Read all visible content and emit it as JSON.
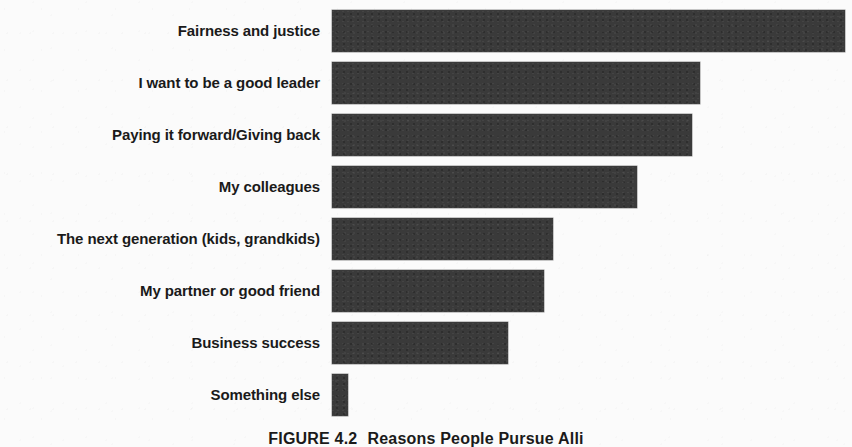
{
  "figure": {
    "caption_label": "FIGURE 4.2",
    "caption_text": "Reasons People Pursue Alli",
    "background_color": "#fbfbfb",
    "bar_color": "#3a3a3a",
    "text_color": "#1a1a1a"
  },
  "chart_data": {
    "type": "bar",
    "orientation": "horizontal",
    "title": "",
    "subtitle": "",
    "xlabel": "",
    "ylabel": "",
    "grid": false,
    "legend": false,
    "axis_visible": false,
    "tick_labels_visible": false,
    "value_labels_visible": false,
    "xlim": [
      0,
      100
    ],
    "categories": [
      "Fairness and justice",
      "I want to be a good leader",
      "Paying it forward/Giving back",
      "My colleagues",
      "The next generation (kids, grandkids)",
      "My partner or good friend",
      "Business success",
      "Something else"
    ],
    "values": [
      100,
      71.8,
      70.2,
      59.5,
      43.1,
      41.3,
      34.3,
      3.1
    ],
    "bar_pixel_widths": [
      513,
      368,
      360,
      305,
      221,
      212,
      176,
      16
    ],
    "series": [
      {
        "name": "Share of respondents",
        "values": [
          100,
          71.8,
          70.2,
          59.5,
          43.1,
          41.3,
          34.3,
          3.1
        ]
      }
    ]
  }
}
